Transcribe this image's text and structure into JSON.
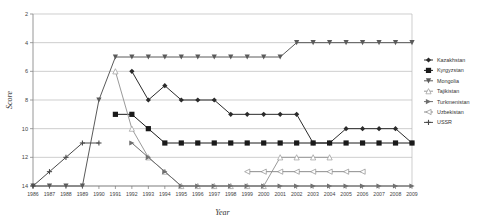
{
  "chart_data": {
    "type": "line",
    "title": "",
    "xlabel": "Year",
    "ylabel": "Score",
    "x": [
      1986,
      1987,
      1988,
      1989,
      1990,
      1991,
      1992,
      1993,
      1994,
      1995,
      1996,
      1997,
      1998,
      1999,
      2000,
      2001,
      2002,
      2003,
      2004,
      2005,
      2006,
      2007,
      2008,
      2009
    ],
    "xlim": [
      1986,
      2009
    ],
    "ylim": [
      2,
      14
    ],
    "y_inverted": true,
    "yticks": [
      2,
      4,
      6,
      8,
      10,
      12,
      14
    ],
    "xticks": [
      "1986",
      "1987",
      "1988",
      "1989",
      "1990",
      "1991",
      "1992",
      "1993",
      "1994",
      "1995",
      "1996",
      "1997",
      "1998",
      "1999",
      "2000",
      "2001",
      "2002",
      "2003",
      "2004",
      "2005",
      "2006",
      "2007",
      "2008",
      "2009"
    ],
    "grid": true,
    "legend_position": "right",
    "series": [
      {
        "name": "Kazakhstan",
        "marker": "diamond",
        "color": "#2b2b2b",
        "values": [
          null,
          null,
          null,
          null,
          null,
          null,
          6,
          8,
          7,
          8,
          8,
          8,
          9,
          9,
          9,
          9,
          9,
          11,
          11,
          10,
          10,
          10,
          10,
          11
        ]
      },
      {
        "name": "Kyrgyzstan",
        "marker": "square",
        "color": "#1a1a1a",
        "values": [
          null,
          null,
          null,
          null,
          null,
          9,
          9,
          10,
          11,
          11,
          11,
          11,
          11,
          11,
          11,
          11,
          11,
          11,
          11,
          11,
          11,
          11,
          11,
          11
        ]
      },
      {
        "name": "Mongolia",
        "marker": "triangle-down",
        "color": "#5a5a5a",
        "values": [
          14,
          14,
          14,
          14,
          8,
          5,
          5,
          5,
          5,
          5,
          5,
          5,
          5,
          5,
          5,
          5,
          4,
          4,
          4,
          4,
          4,
          4,
          4,
          4
        ]
      },
      {
        "name": "Tajikistan",
        "marker": "triangle-up-open",
        "color": "#9a9a9a",
        "values": [
          null,
          null,
          null,
          null,
          null,
          6,
          10,
          12,
          13,
          14,
          14,
          14,
          14,
          14,
          14,
          12,
          12,
          12,
          12,
          null,
          null,
          null,
          null,
          null
        ]
      },
      {
        "name": "Turkmenistan",
        "marker": "triangle-right",
        "color": "#6f6f6f",
        "values": [
          null,
          null,
          null,
          null,
          null,
          null,
          11,
          12,
          13,
          14,
          14,
          14,
          14,
          14,
          14,
          14,
          14,
          14,
          14,
          14,
          14,
          14,
          14,
          14
        ]
      },
      {
        "name": "Uzbekistan",
        "marker": "triangle-left-open",
        "color": "#8d8d8d",
        "values": [
          null,
          null,
          null,
          null,
          null,
          null,
          null,
          null,
          null,
          null,
          null,
          null,
          null,
          13,
          13,
          13,
          13,
          13,
          13,
          13,
          13,
          null,
          null,
          null
        ]
      },
      {
        "name": "USSR",
        "marker": "plus",
        "color": "#4a4a4a",
        "values": [
          14,
          13,
          12,
          11,
          11,
          null,
          null,
          null,
          null,
          null,
          null,
          null,
          null,
          null,
          null,
          null,
          null,
          null,
          null,
          null,
          null,
          null,
          null,
          null
        ]
      }
    ]
  }
}
